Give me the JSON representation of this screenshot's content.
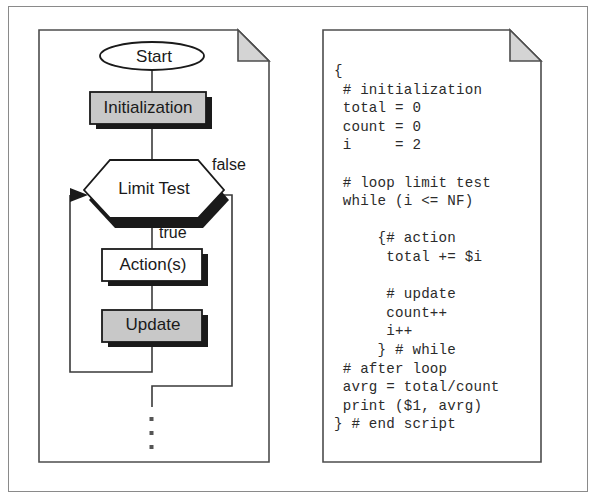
{
  "figure": {
    "panels": {
      "flowchart": {
        "name": "loop-flowchart",
        "nodes": {
          "start": "Start",
          "initialization": "Initialization",
          "limit_test": "Limit Test",
          "actions": "Action(s)",
          "update": "Update"
        },
        "edge_labels": {
          "false_branch": "false",
          "true_branch": "true"
        },
        "continuation": "⋮"
      },
      "code": {
        "name": "awk-script",
        "lines": [
          "{",
          " # initialization",
          " total = 0",
          " count = 0",
          " i     = 2",
          "",
          " # loop limit test",
          " while (i <= NF)",
          "",
          "     {# action",
          "      total += $i",
          "",
          "      # update",
          "      count++",
          "      i++",
          "     } # while",
          " # after loop",
          " avrg = total/count",
          " print ($1, avrg)",
          "} # end script"
        ]
      }
    },
    "colors": {
      "shaded_node_fill": "#c8c8c8",
      "plain_node_fill": "#ffffff",
      "node_stroke": "#1a1a1a",
      "shadow": "#1a1a1a",
      "panel_stroke": "#4d4d4d",
      "fold_fill": "#d4d4d4",
      "frame_stroke": "#8a8a8a",
      "text": "#1a1a1a",
      "code_text": "#2b2b2b"
    }
  }
}
